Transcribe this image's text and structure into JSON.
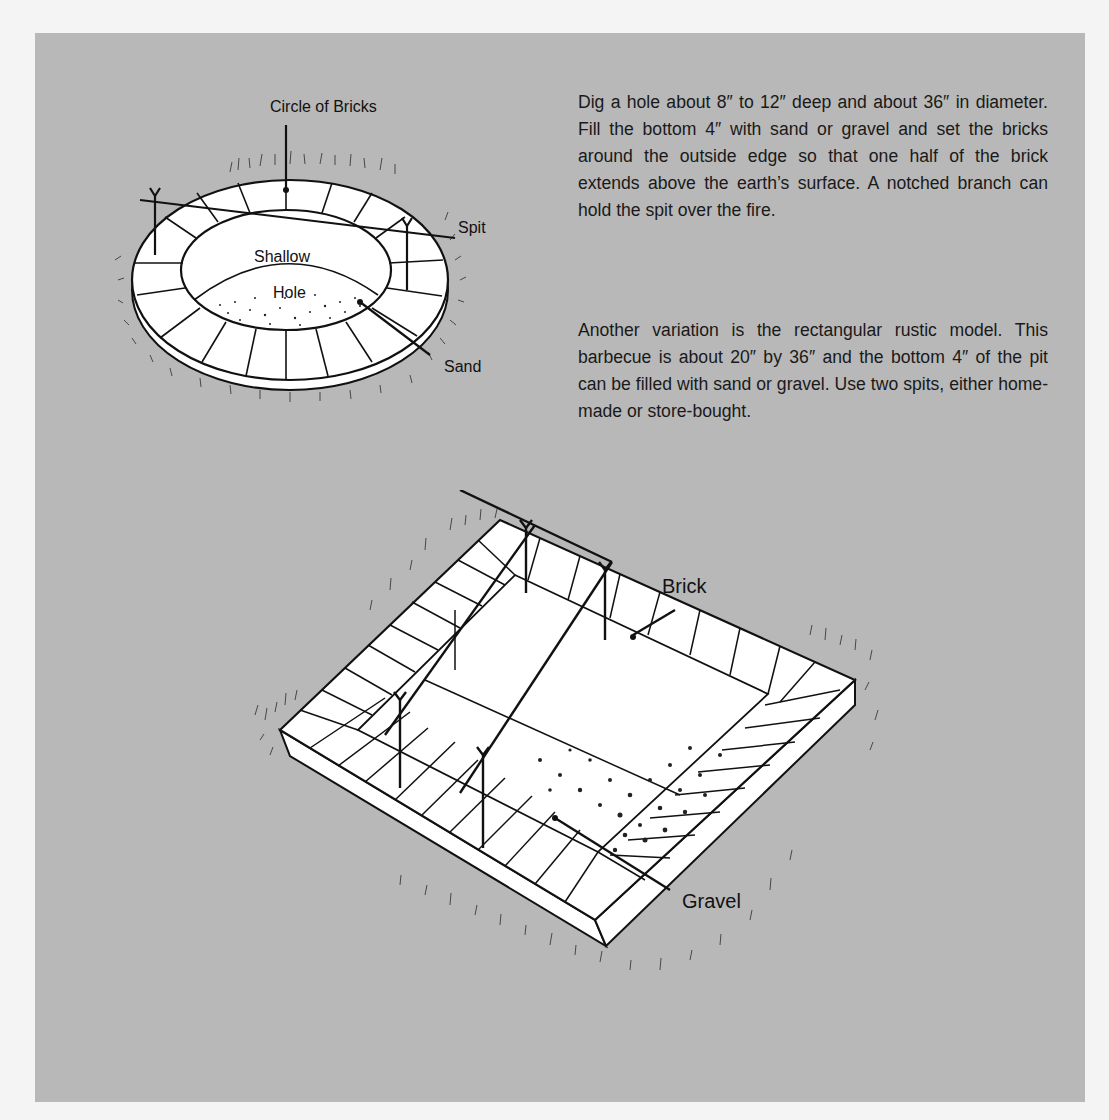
{
  "paragraphs": [
    "Dig a hole about 8″ to 12″ deep and about 36″ in diameter. Fill the bottom 4″ with sand or gravel and set the bricks around the outside edge so that one half of the brick extends above the earth’s surface. A notched branch can hold the spit over the fire.",
    "Another variation is the rectangular rustic model. This barbecue is about 20″ by 36″ and the bottom 4″ of the pit can be filled with sand or gravel. Use two spits, either home-made or store-bought."
  ],
  "figures": {
    "round_pit": {
      "labels": {
        "circle_of_bricks": "Circle of Bricks",
        "spit": "Spit",
        "shallow": "Shallow",
        "hole": "Hole",
        "sand": "Sand"
      }
    },
    "rectangular_pit": {
      "labels": {
        "brick": "Brick",
        "gravel": "Gravel"
      }
    }
  },
  "colors": {
    "panel": "#b8b8b8",
    "page": "#f4f4f4",
    "ink": "#111111",
    "brick_fill": "#ffffff"
  }
}
